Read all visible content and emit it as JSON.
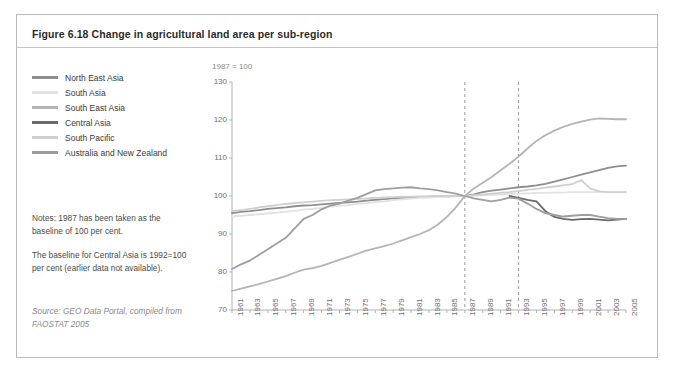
{
  "figure": {
    "title": "Figure 6.18 Change in agricultural land area per sub-region",
    "baseline_note": "1987 = 100",
    "notes": [
      "Notes: 1987 has been taken as the baseline of 100 per cent.",
      "The baseline for Central Asia is 1992=100 per cent (earlier data not available)."
    ],
    "source": "Source: GEO Data Portal, compiled from FAOSTAT 2005"
  },
  "legend": {
    "items": [
      {
        "label": "North East Asia",
        "color": "#8e8e8e"
      },
      {
        "label": "South Asia",
        "color": "#e2e2e2"
      },
      {
        "label": "South East Asia",
        "color": "#b4b4b4"
      },
      {
        "label": "Central Asia",
        "color": "#6a6a6a"
      },
      {
        "label": "South Pacific",
        "color": "#cfcfcf"
      },
      {
        "label": "Australia and New Zealand",
        "color": "#9e9e9e"
      }
    ]
  },
  "chart_data": {
    "type": "line",
    "title": "Figure 6.18 Change in agricultural land area per sub-region",
    "xlabel": "",
    "ylabel": "1987 = 100",
    "ylim": [
      70,
      130
    ],
    "yticks": [
      70,
      80,
      90,
      100,
      110,
      120,
      130
    ],
    "grid": false,
    "legend_position": "left",
    "x": [
      1961,
      1962,
      1963,
      1964,
      1965,
      1966,
      1967,
      1968,
      1969,
      1970,
      1971,
      1972,
      1973,
      1974,
      1975,
      1976,
      1977,
      1978,
      1979,
      1980,
      1981,
      1982,
      1983,
      1984,
      1985,
      1986,
      1987,
      1988,
      1989,
      1990,
      1991,
      1992,
      1993,
      1994,
      1995,
      1996,
      1997,
      1998,
      1999,
      2000,
      2001,
      2002,
      2003,
      2004,
      2005
    ],
    "xtick_labels": [
      "1961",
      "1963",
      "1965",
      "1967",
      "1969",
      "1971",
      "1973",
      "1975",
      "1977",
      "1979",
      "1981",
      "1983",
      "1985",
      "1987",
      "1989",
      "1991",
      "1993",
      "1995",
      "1997",
      "1999",
      "2001",
      "2003",
      "2005"
    ],
    "annotations": [
      {
        "type": "vertical-dashed-line",
        "x": 1987
      },
      {
        "type": "vertical-dashed-line",
        "x": 1993
      }
    ],
    "series": [
      {
        "name": "North East Asia",
        "color": "#8e8e8e",
        "values": [
          95.5,
          95.8,
          96.0,
          96.3,
          96.6,
          96.8,
          97.0,
          97.3,
          97.5,
          97.6,
          97.8,
          98.0,
          98.2,
          98.3,
          98.5,
          98.8,
          99.0,
          99.2,
          99.4,
          99.5,
          99.6,
          99.7,
          99.8,
          99.9,
          99.9,
          100.0,
          100.0,
          100.4,
          101.0,
          101.4,
          101.7,
          102.0,
          102.3,
          102.5,
          102.8,
          103.2,
          103.8,
          104.4,
          105.0,
          105.6,
          106.2,
          106.8,
          107.4,
          107.8,
          108.0
        ]
      },
      {
        "name": "South Asia",
        "color": "#e2e2e2",
        "values": [
          94.6,
          94.8,
          95.0,
          95.2,
          95.4,
          95.6,
          95.9,
          96.1,
          96.4,
          96.6,
          96.9,
          97.2,
          97.4,
          97.6,
          97.9,
          98.1,
          98.4,
          98.6,
          98.9,
          99.1,
          99.3,
          99.5,
          99.6,
          99.8,
          99.9,
          100.0,
          100.0,
          100.1,
          100.2,
          100.3,
          100.4,
          100.5,
          100.6,
          100.7,
          100.8,
          100.8,
          100.9,
          100.9,
          101.0,
          101.0,
          101.0,
          101.0,
          101.1,
          101.1,
          101.1
        ]
      },
      {
        "name": "South East Asia",
        "color": "#b4b4b4",
        "values": [
          75.0,
          75.6,
          76.2,
          76.8,
          77.5,
          78.2,
          78.9,
          79.8,
          80.6,
          81.0,
          81.6,
          82.4,
          83.2,
          84.0,
          84.8,
          85.6,
          86.2,
          86.8,
          87.5,
          88.3,
          89.2,
          90.0,
          91.0,
          92.5,
          94.5,
          97.0,
          100.0,
          102.0,
          103.5,
          105.0,
          106.8,
          108.5,
          110.4,
          112.5,
          114.5,
          116.0,
          117.2,
          118.2,
          119.0,
          119.6,
          120.1,
          120.4,
          120.3,
          120.2,
          120.2
        ]
      },
      {
        "name": "Central Asia",
        "color": "#6a6a6a",
        "values": [
          null,
          null,
          null,
          null,
          null,
          null,
          null,
          null,
          null,
          null,
          null,
          null,
          null,
          null,
          null,
          null,
          null,
          null,
          null,
          null,
          null,
          null,
          null,
          null,
          null,
          null,
          null,
          null,
          null,
          null,
          null,
          100.0,
          99.5,
          99.0,
          98.6,
          96.0,
          94.5,
          94.0,
          93.7,
          93.9,
          94.0,
          93.8,
          93.6,
          93.8,
          94.0
        ]
      },
      {
        "name": "South Pacific",
        "color": "#cfcfcf",
        "values": [
          96.0,
          96.3,
          96.6,
          97.0,
          97.3,
          97.6,
          97.9,
          98.1,
          98.3,
          98.5,
          98.7,
          98.9,
          99.0,
          99.1,
          99.2,
          99.4,
          99.5,
          99.6,
          99.7,
          99.8,
          99.8,
          99.9,
          99.9,
          100.0,
          100.0,
          100.0,
          100.0,
          100.2,
          100.4,
          100.6,
          100.8,
          101.0,
          101.3,
          101.6,
          101.9,
          102.2,
          102.5,
          102.8,
          103.1,
          104.2,
          102.0,
          101.2,
          101.0,
          101.0,
          101.0
        ]
      },
      {
        "name": "Australia and New Zealand",
        "color": "#9e9e9e",
        "values": [
          80.8,
          82.0,
          83.0,
          84.5,
          86.0,
          87.5,
          89.0,
          91.5,
          94.0,
          95.0,
          96.5,
          97.5,
          98.0,
          98.8,
          99.5,
          100.5,
          101.5,
          101.8,
          102.0,
          102.2,
          102.3,
          102.0,
          101.8,
          101.5,
          101.0,
          100.6,
          100.0,
          99.4,
          99.0,
          98.6,
          99.0,
          99.6,
          99.3,
          98.0,
          96.6,
          95.5,
          95.0,
          94.6,
          94.8,
          95.0,
          95.0,
          94.6,
          94.2,
          94.0,
          94.0
        ]
      }
    ]
  }
}
